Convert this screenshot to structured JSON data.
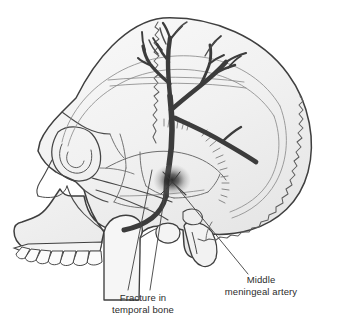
{
  "figure": {
    "type": "anatomical-illustration",
    "view": "lateral",
    "background_color": "#ffffff"
  },
  "labels": {
    "fracture": {
      "line1": "Fracture in",
      "line2": "temporal bone",
      "leader_target": "temporal-squamous-region"
    },
    "artery": {
      "line1": "Middle",
      "line2": "meningeal artery",
      "leader_target": "artery-trunk-at-fracture"
    }
  },
  "colors": {
    "outline": "#3f3f3f",
    "suture": "#6e6e6e",
    "bone_fill": "#f1f1f1",
    "bone_fill_light": "#f7f7f7",
    "artery": "#3c3c3c",
    "artery_light": "#585858",
    "fracture_blur": "#2a2a2a",
    "text": "#2b2b2b",
    "leader_line": "#4a4a4a"
  },
  "structures": {
    "cranial_vault": "calvaria",
    "sutures": [
      "coronal suture",
      "lambdoid suture",
      "squamous suture"
    ],
    "facial_bones": [
      "frontal bone",
      "nasal bone",
      "orbit",
      "zygomatic arch",
      "maxilla"
    ],
    "mandible_parts": [
      "condyle",
      "coronoid process",
      "ramus"
    ],
    "temporal_parts": [
      "mastoid process",
      "external acoustic meatus",
      "squamous part"
    ],
    "teeth_count": 7,
    "artery_description": "Middle meningeal artery with anterior and posterior divisions branching across the temporal and parietal bones",
    "fracture_description": "Dark blurred fracture site over the temporal bone at the artery trunk"
  }
}
